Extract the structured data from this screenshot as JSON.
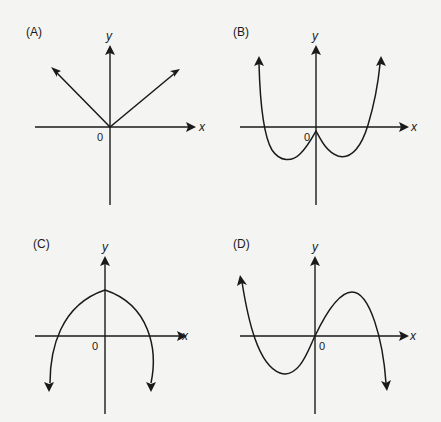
{
  "figure": {
    "colors": {
      "background": "#f4f4f2",
      "ink": "#1a1a1a"
    },
    "panels": [
      {
        "id": "A",
        "label": "(A)",
        "x_label": "x",
        "y_label": "y",
        "origin_label": "0",
        "shape": "absolute-value V through origin"
      },
      {
        "id": "B",
        "label": "(B)",
        "x_label": "x",
        "y_label": "y",
        "origin_label": "0",
        "shape": "W-shaped curve with cusp near origin"
      },
      {
        "id": "C",
        "label": "(C)",
        "x_label": "x",
        "y_label": "y",
        "origin_label": "0",
        "shape": "downward-opening curve with maximum on y-axis"
      },
      {
        "id": "D",
        "label": "(D)",
        "x_label": "x",
        "y_label": "y",
        "origin_label": "0",
        "shape": "cubic through origin, rising left end, falling right end"
      }
    ]
  }
}
